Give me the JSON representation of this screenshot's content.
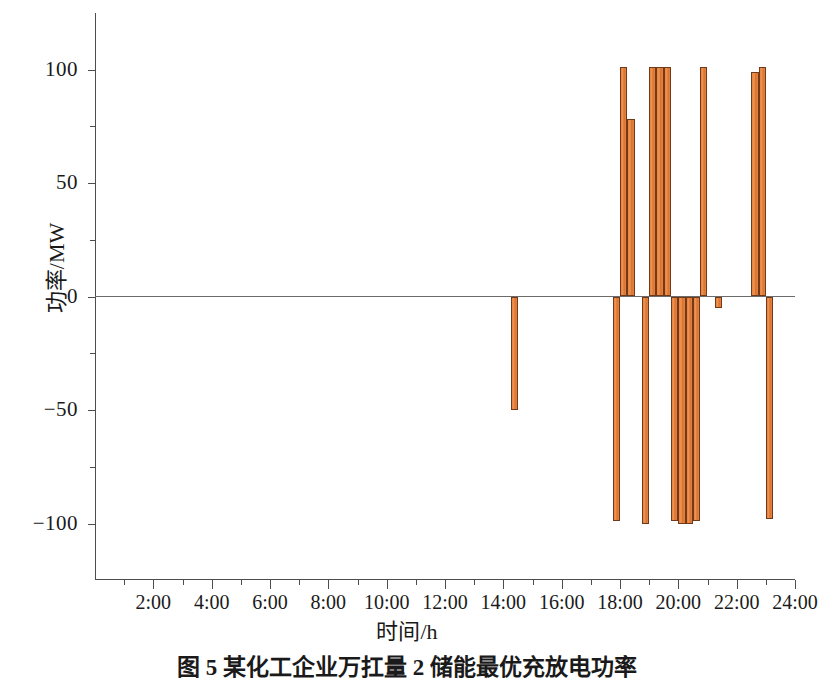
{
  "figure": {
    "caption": "图 5  某化工企业万扛量 2 储能最优充放电功率",
    "bar_color": "#e8833c",
    "bar_border_color": "#6e3a1b",
    "axis_color": "#4d4d4d"
  },
  "chart_data": {
    "type": "bar",
    "title": "",
    "xlabel": "时间/h",
    "ylabel": "功率/MW",
    "xlim": [
      0,
      24
    ],
    "ylim": [
      -125,
      125
    ],
    "ytick_labels": [
      "100",
      "50",
      "0",
      "−50",
      "−100"
    ],
    "ytick_values": [
      100,
      50,
      0,
      -50,
      -100
    ],
    "yminor_values": [
      75,
      25,
      -25,
      -75
    ],
    "xtick_labels": [
      "2:00",
      "4:00",
      "6:00",
      "8:00",
      "10:00",
      "12:00",
      "14:00",
      "16:00",
      "18:00",
      "20:00",
      "22:00",
      "24:00"
    ],
    "xtick_values": [
      2,
      4,
      6,
      8,
      10,
      12,
      14,
      16,
      18,
      20,
      22,
      24
    ],
    "grid": false,
    "legend": null,
    "bars": [
      {
        "t_start": 14.25,
        "t_end": 14.5,
        "value": -50
      },
      {
        "t_start": 17.75,
        "t_end": 18.0,
        "value": -99
      },
      {
        "t_start": 18.0,
        "t_end": 18.25,
        "value": 101
      },
      {
        "t_start": 18.25,
        "t_end": 18.5,
        "value": 78
      },
      {
        "t_start": 18.75,
        "t_end": 19.0,
        "value": -100
      },
      {
        "t_start": 19.0,
        "t_end": 19.25,
        "value": 101
      },
      {
        "t_start": 19.25,
        "t_end": 19.5,
        "value": 101
      },
      {
        "t_start": 19.5,
        "t_end": 19.75,
        "value": 101
      },
      {
        "t_start": 19.75,
        "t_end": 20.0,
        "value": -99
      },
      {
        "t_start": 20.0,
        "t_end": 20.25,
        "value": -100
      },
      {
        "t_start": 20.25,
        "t_end": 20.5,
        "value": -100
      },
      {
        "t_start": 20.5,
        "t_end": 20.75,
        "value": -99
      },
      {
        "t_start": 20.75,
        "t_end": 21.0,
        "value": 101
      },
      {
        "t_start": 21.25,
        "t_end": 21.5,
        "value": -5
      },
      {
        "t_start": 22.5,
        "t_end": 22.75,
        "value": 99
      },
      {
        "t_start": 22.75,
        "t_end": 23.0,
        "value": 101
      },
      {
        "t_start": 23.0,
        "t_end": 23.25,
        "value": -98
      }
    ]
  }
}
